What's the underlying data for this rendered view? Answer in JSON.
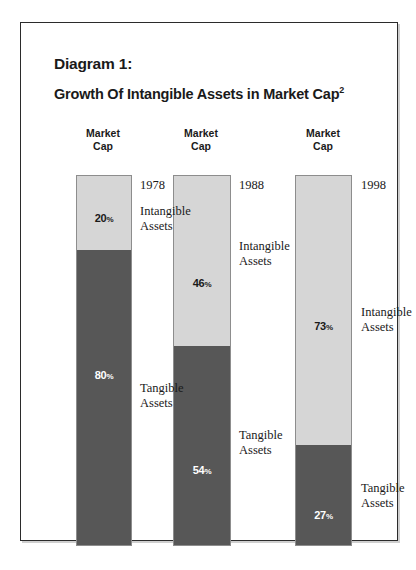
{
  "figure": {
    "title_main": "Diagram 1:",
    "title_sub": "Growth Of Intangible Assets in Market Cap",
    "title_superscript": "2",
    "column_header_line1": "Market",
    "column_header_line2": "Cap",
    "intangible_label_line1": "Intangible",
    "intangible_label_line2": "Assets",
    "tangible_label_line1": "Tangible",
    "tangible_label_line2": "Assets",
    "percent_sign": "%"
  },
  "colors": {
    "intangible": "#d6d6d6",
    "tangible": "#575757",
    "frame": "#2b2b2b",
    "text": "#1a1a1a"
  },
  "chart_data": {
    "type": "bar",
    "title": "Growth Of Intangible Assets in Market Cap",
    "subtitle": "Diagram 1:",
    "stacked": true,
    "stack_total": 100,
    "categories": [
      "1978",
      "1988",
      "1998"
    ],
    "xlabel": "",
    "ylabel": "Market Cap",
    "ylim": [
      0,
      100
    ],
    "grid": false,
    "legend_position": "inline-right-of-bars",
    "series": [
      {
        "name": "Intangible Assets",
        "values": [
          20,
          46,
          73
        ],
        "color": "#d6d6d6"
      },
      {
        "name": "Tangible Assets",
        "values": [
          80,
          54,
          27
        ],
        "color": "#575757"
      }
    ],
    "bars": [
      {
        "year": "1978",
        "header_line1": "Market",
        "header_line2": "Cap",
        "intangible_pct": 20,
        "intangible_label": "20",
        "tangible_pct": 80,
        "tangible_label": "80",
        "intangible_name_line1": "Intangible",
        "intangible_name_line2": "Assets",
        "tangible_name_line1": "Tangible",
        "tangible_name_line2": "Assets"
      },
      {
        "year": "1988",
        "header_line1": "Market",
        "header_line2": "Cap",
        "intangible_pct": 46,
        "intangible_label": "46",
        "tangible_pct": 54,
        "tangible_label": "54",
        "intangible_name_line1": "Intangible",
        "intangible_name_line2": "Assets",
        "tangible_name_line1": "Tangible",
        "tangible_name_line2": "Assets"
      },
      {
        "year": "1998",
        "header_line1": "Market",
        "header_line2": "Cap",
        "intangible_pct": 73,
        "intangible_label": "73",
        "tangible_pct": 27,
        "tangible_label": "27",
        "intangible_name_line1": "Intangible",
        "intangible_name_line2": "Assets",
        "tangible_name_line1": "Tangible",
        "tangible_name_line2": "Assets"
      }
    ],
    "annotations": [
      "1978",
      "1988",
      "1998",
      "Intangible Assets",
      "Tangible Assets"
    ]
  }
}
